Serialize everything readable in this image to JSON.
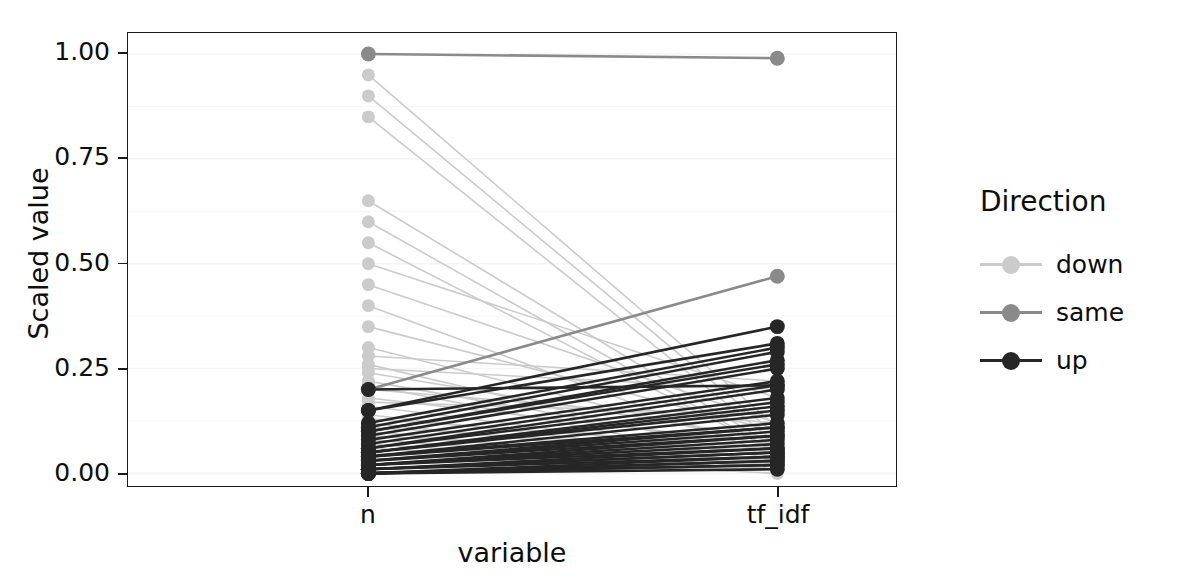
{
  "chart_data": {
    "type": "line",
    "title": "",
    "xlabel": "variable",
    "ylabel": "Scaled value",
    "categories": [
      "n",
      "tf_idf"
    ],
    "x": [
      "n",
      "tf_idf"
    ],
    "ylim": [
      -0.03,
      1.05
    ],
    "y_ticks": [
      0.0,
      0.25,
      0.5,
      0.75,
      1.0
    ],
    "y_tick_labels": [
      "0.00",
      "0.25",
      "0.50",
      "0.75",
      "1.00"
    ],
    "grid": true,
    "legend": {
      "title": "Direction",
      "position": "right",
      "entries": [
        {
          "label": "down",
          "color": "#CBCBCB"
        },
        {
          "label": "same",
          "color": "#8A8A8A"
        },
        {
          "label": "up",
          "color": "#262626"
        }
      ]
    },
    "colors": {
      "down": "#CBCBCB",
      "same": "#8A8A8A",
      "up": "#262626",
      "axis": "#1a1a1a",
      "grid": "#f4f4f4",
      "background": "#ffffff"
    },
    "series": [
      {
        "name": "s01",
        "direction": "same",
        "values": [
          1.0,
          0.99
        ]
      },
      {
        "name": "s02",
        "direction": "down",
        "values": [
          0.95,
          0.11
        ]
      },
      {
        "name": "s03",
        "direction": "down",
        "values": [
          0.9,
          0.09
        ]
      },
      {
        "name": "s04",
        "direction": "down",
        "values": [
          0.85,
          0.07
        ]
      },
      {
        "name": "s05",
        "direction": "down",
        "values": [
          0.65,
          0.06
        ]
      },
      {
        "name": "s06",
        "direction": "down",
        "values": [
          0.6,
          0.05
        ]
      },
      {
        "name": "s07",
        "direction": "down",
        "values": [
          0.55,
          0.05
        ]
      },
      {
        "name": "s08",
        "direction": "down",
        "values": [
          0.5,
          0.18
        ]
      },
      {
        "name": "s09",
        "direction": "down",
        "values": [
          0.45,
          0.12
        ]
      },
      {
        "name": "s10",
        "direction": "down",
        "values": [
          0.4,
          0.04
        ]
      },
      {
        "name": "s11",
        "direction": "down",
        "values": [
          0.35,
          0.1
        ]
      },
      {
        "name": "s12",
        "direction": "down",
        "values": [
          0.3,
          0.06
        ]
      },
      {
        "name": "s13",
        "direction": "down",
        "values": [
          0.28,
          0.22
        ]
      },
      {
        "name": "s14",
        "direction": "down",
        "values": [
          0.26,
          0.03
        ]
      },
      {
        "name": "s15",
        "direction": "down",
        "values": [
          0.25,
          0.2
        ]
      },
      {
        "name": "s16",
        "direction": "down",
        "values": [
          0.24,
          0.08
        ]
      },
      {
        "name": "s17",
        "direction": "down",
        "values": [
          0.22,
          0.05
        ]
      },
      {
        "name": "s18",
        "direction": "down",
        "values": [
          0.21,
          0.02
        ]
      },
      {
        "name": "s19",
        "direction": "down",
        "values": [
          0.2,
          0.12
        ]
      },
      {
        "name": "s20",
        "direction": "down",
        "values": [
          0.18,
          0.07
        ]
      },
      {
        "name": "s21",
        "direction": "down",
        "values": [
          0.17,
          0.14
        ]
      },
      {
        "name": "s22",
        "direction": "down",
        "values": [
          0.16,
          0.04
        ]
      },
      {
        "name": "s23",
        "direction": "down",
        "values": [
          0.14,
          0.03
        ]
      },
      {
        "name": "s24",
        "direction": "down",
        "values": [
          0.13,
          0.06
        ]
      },
      {
        "name": "s25",
        "direction": "down",
        "values": [
          0.12,
          0.02
        ]
      },
      {
        "name": "s26",
        "direction": "down",
        "values": [
          0.11,
          0.05
        ]
      },
      {
        "name": "s27",
        "direction": "down",
        "values": [
          0.1,
          0.01
        ]
      },
      {
        "name": "s28",
        "direction": "down",
        "values": [
          0.09,
          0.03
        ]
      },
      {
        "name": "s29",
        "direction": "down",
        "values": [
          0.08,
          0.02
        ]
      },
      {
        "name": "s30",
        "direction": "down",
        "values": [
          0.07,
          0.01
        ]
      },
      {
        "name": "s31",
        "direction": "down",
        "values": [
          0.06,
          0.01
        ]
      },
      {
        "name": "s32",
        "direction": "down",
        "values": [
          0.05,
          0.0
        ]
      },
      {
        "name": "s33",
        "direction": "same",
        "values": [
          0.2,
          0.47
        ]
      },
      {
        "name": "s34",
        "direction": "up",
        "values": [
          0.2,
          0.21
        ]
      },
      {
        "name": "s35",
        "direction": "up",
        "values": [
          0.15,
          0.35
        ]
      },
      {
        "name": "s36",
        "direction": "up",
        "values": [
          0.15,
          0.31
        ]
      },
      {
        "name": "s37",
        "direction": "up",
        "values": [
          0.12,
          0.3
        ]
      },
      {
        "name": "s38",
        "direction": "up",
        "values": [
          0.11,
          0.29
        ]
      },
      {
        "name": "s39",
        "direction": "up",
        "values": [
          0.1,
          0.27
        ]
      },
      {
        "name": "s40",
        "direction": "up",
        "values": [
          0.1,
          0.26
        ]
      },
      {
        "name": "s41",
        "direction": "up",
        "values": [
          0.09,
          0.25
        ]
      },
      {
        "name": "s42",
        "direction": "up",
        "values": [
          0.08,
          0.22
        ]
      },
      {
        "name": "s43",
        "direction": "up",
        "values": [
          0.07,
          0.21
        ]
      },
      {
        "name": "s44",
        "direction": "up",
        "values": [
          0.06,
          0.2
        ]
      },
      {
        "name": "s45",
        "direction": "up",
        "values": [
          0.06,
          0.18
        ]
      },
      {
        "name": "s46",
        "direction": "up",
        "values": [
          0.05,
          0.17
        ]
      },
      {
        "name": "s47",
        "direction": "up",
        "values": [
          0.05,
          0.16
        ]
      },
      {
        "name": "s48",
        "direction": "up",
        "values": [
          0.05,
          0.15
        ]
      },
      {
        "name": "s49",
        "direction": "up",
        "values": [
          0.04,
          0.14
        ]
      },
      {
        "name": "s50",
        "direction": "up",
        "values": [
          0.04,
          0.12
        ]
      },
      {
        "name": "s51",
        "direction": "up",
        "values": [
          0.04,
          0.11
        ]
      },
      {
        "name": "s52",
        "direction": "up",
        "values": [
          0.03,
          0.11
        ]
      },
      {
        "name": "s53",
        "direction": "up",
        "values": [
          0.03,
          0.1
        ]
      },
      {
        "name": "s54",
        "direction": "up",
        "values": [
          0.03,
          0.09
        ]
      },
      {
        "name": "s55",
        "direction": "up",
        "values": [
          0.02,
          0.09
        ]
      },
      {
        "name": "s56",
        "direction": "up",
        "values": [
          0.02,
          0.08
        ]
      },
      {
        "name": "s57",
        "direction": "up",
        "values": [
          0.02,
          0.07
        ]
      },
      {
        "name": "s58",
        "direction": "up",
        "values": [
          0.02,
          0.06
        ]
      },
      {
        "name": "s59",
        "direction": "up",
        "values": [
          0.01,
          0.06
        ]
      },
      {
        "name": "s60",
        "direction": "up",
        "values": [
          0.01,
          0.05
        ]
      },
      {
        "name": "s61",
        "direction": "up",
        "values": [
          0.01,
          0.05
        ]
      },
      {
        "name": "s62",
        "direction": "up",
        "values": [
          0.01,
          0.04
        ]
      },
      {
        "name": "s63",
        "direction": "up",
        "values": [
          0.0,
          0.04
        ]
      },
      {
        "name": "s64",
        "direction": "up",
        "values": [
          0.0,
          0.03
        ]
      },
      {
        "name": "s65",
        "direction": "up",
        "values": [
          0.0,
          0.03
        ]
      },
      {
        "name": "s66",
        "direction": "up",
        "values": [
          0.0,
          0.02
        ]
      },
      {
        "name": "s67",
        "direction": "up",
        "values": [
          0.0,
          0.02
        ]
      },
      {
        "name": "s68",
        "direction": "up",
        "values": [
          0.0,
          0.01
        ]
      }
    ]
  }
}
